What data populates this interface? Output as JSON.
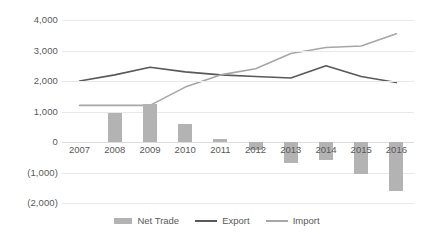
{
  "chart_data": {
    "type": "bar",
    "title": "",
    "subtitle": "",
    "xlabel": "",
    "ylabel": "",
    "categories": [
      "2007",
      "2008",
      "2009",
      "2010",
      "2011",
      "2012",
      "2013",
      "2014",
      "2015",
      "2016"
    ],
    "ylim": [
      -2000,
      4000
    ],
    "ytick_values": [
      4000,
      3000,
      2000,
      1000,
      0,
      -1000,
      -2000
    ],
    "ytick_labels": [
      "4,000",
      "3,000",
      "2,000",
      "1,000",
      "0",
      "(1,000)",
      "(2,000)"
    ],
    "grid": true,
    "legend_position": "bottom",
    "series": [
      {
        "name": "Net Trade",
        "type": "bar",
        "color": "#b3b3b3",
        "values": [
          0,
          950,
          1250,
          600,
          100,
          -250,
          -700,
          -600,
          -1050,
          -1600
        ]
      },
      {
        "name": "Export",
        "type": "line",
        "color": "#595959",
        "values": [
          2000,
          2200,
          2450,
          2300,
          2200,
          2150,
          2100,
          2500,
          2150,
          1950
        ]
      },
      {
        "name": "Import",
        "type": "line",
        "color": "#a6a6a6",
        "values": [
          1200,
          1200,
          1200,
          1800,
          2200,
          2400,
          2900,
          3100,
          3150,
          3550
        ]
      }
    ]
  },
  "legend": {
    "items": [
      {
        "label": "Net Trade",
        "marker": "bar-swatch",
        "color": "#b3b3b3"
      },
      {
        "label": "Export",
        "marker": "line-swatch",
        "color": "#595959"
      },
      {
        "label": "Import",
        "marker": "line-swatch",
        "color": "#a6a6a6"
      }
    ]
  },
  "colors": {
    "gridline": "#e8e8e8",
    "zero_line": "#dcdcdc",
    "text": "#595959",
    "background": "#ffffff"
  }
}
